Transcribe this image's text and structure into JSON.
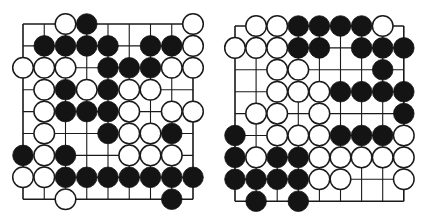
{
  "colors": {
    "background": "#ffffff",
    "line": "#1a1a1a",
    "black_stone": "#141414",
    "white_stone": "#ffffff",
    "stone_outline": "#1a1a1a"
  },
  "boards": [
    {
      "id": "left",
      "origin_x": 23,
      "origin_y": 24,
      "spacing_x": 21.25,
      "spacing_y": 21.9,
      "cols": 9,
      "rows": 9,
      "stone_radius": 10.3,
      "grid": [
        "..WB....W",
        ".BBBB.BBW",
        "WWW.BBBWW",
        ".WBWBWW..",
        ".WBBBW.WW",
        ".W..BWWB.",
        "BWB..WWW.",
        "WWBBBBBBB",
        "..W....B."
      ]
    },
    {
      "id": "right",
      "origin_x": 235,
      "origin_y": 26,
      "spacing_x": 21.1,
      "spacing_y": 21.9,
      "cols": 9,
      "rows": 9,
      "stone_radius": 10.3,
      "grid": [
        ".WWBBBBW.",
        "WWWBB.BBB",
        "..WW...B.",
        "..WWWBBBB",
        ".WW.W...B",
        "B.WWWBBBW",
        "BWBBWWWWW",
        "BBBBWW..W",
        ".B.B....."
      ]
    }
  ]
}
